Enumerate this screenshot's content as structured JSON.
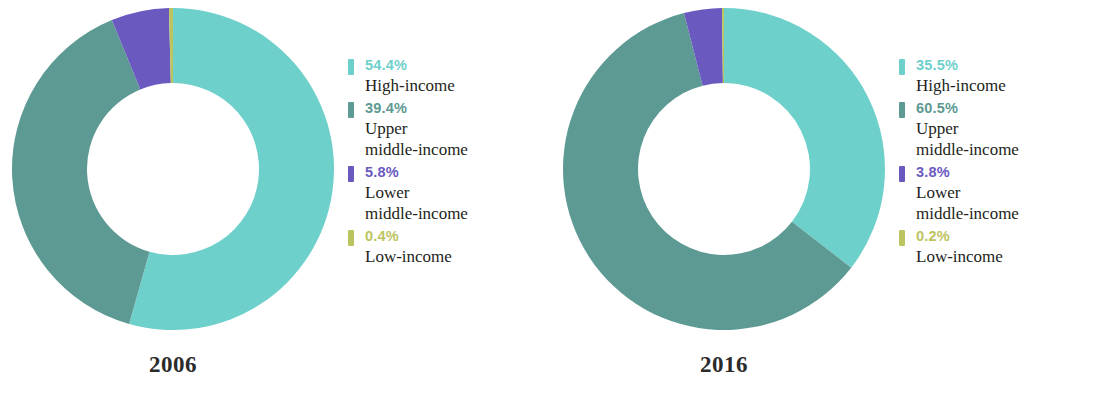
{
  "figure": {
    "background": "#ffffff",
    "type": "two-donut-charts"
  },
  "colors": {
    "high_income": "#6ed0cb",
    "upper_middle_income": "#5d9a93",
    "lower_middle_income": "#6a5ac0",
    "low_income": "#bcc45f",
    "category_text": "#231f20",
    "year_text": "#2b2b2b"
  },
  "panels": [
    {
      "year": "2006",
      "legend": [
        {
          "pct": "54.4%",
          "category": "High-income",
          "color": "#6ed0cb"
        },
        {
          "pct": "39.4%",
          "category": "Upper\nmiddle-income",
          "color": "#5d9a93"
        },
        {
          "pct": "5.8%",
          "category": "Lower\nmiddle-income",
          "color": "#6a5ac0"
        },
        {
          "pct": "0.4%",
          "category": "Low-income",
          "color": "#bcc45f"
        }
      ]
    },
    {
      "year": "2016",
      "legend": [
        {
          "pct": "35.5%",
          "category": "High-income",
          "color": "#6ed0cb"
        },
        {
          "pct": "60.5%",
          "category": "Upper\nmiddle-income",
          "color": "#5d9a93"
        },
        {
          "pct": "3.8%",
          "category": "Lower\nmiddle-income",
          "color": "#6a5ac0"
        },
        {
          "pct": "0.2%",
          "category": "Low-income",
          "color": "#bcc45f"
        }
      ]
    }
  ],
  "chart_data": [
    {
      "type": "pie",
      "title": "2006",
      "variant": "donut",
      "start_angle_deg": 0,
      "direction": "clockwise",
      "inner_radius_ratio": 0.535,
      "labels": [
        "High-income",
        "Upper middle-income",
        "Lower middle-income",
        "Low-income"
      ],
      "values": [
        54.4,
        39.4,
        5.8,
        0.4
      ],
      "value_labels": [
        "54.4%",
        "39.4%",
        "5.8%",
        "0.4%"
      ],
      "colors": [
        "#6ed0cb",
        "#5d9a93",
        "#6a5ac0",
        "#bcc45f"
      ],
      "legend_position": "right",
      "units": "percent"
    },
    {
      "type": "pie",
      "title": "2016",
      "variant": "donut",
      "start_angle_deg": 0,
      "direction": "clockwise",
      "inner_radius_ratio": 0.535,
      "labels": [
        "High-income",
        "Upper middle-income",
        "Lower middle-income",
        "Low-income"
      ],
      "values": [
        35.5,
        60.5,
        3.8,
        0.2
      ],
      "value_labels": [
        "35.5%",
        "60.5%",
        "3.8%",
        "0.2%"
      ],
      "colors": [
        "#6ed0cb",
        "#5d9a93",
        "#6a5ac0",
        "#bcc45f"
      ],
      "legend_position": "right",
      "units": "percent"
    }
  ]
}
